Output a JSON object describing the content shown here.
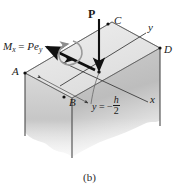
{
  "figure": {
    "caption": "(b)",
    "background_color": "#ffffff",
    "line_color": "#1a1a1a"
  },
  "loads": {
    "force": {
      "label": "P",
      "name": "axial-force-P",
      "direction": "downward-vertical"
    },
    "moment": {
      "label_full": "Mx = Pey",
      "symbol": "M",
      "symbol_sub": "x",
      "equals": "=",
      "rhs": "Pe",
      "rhs_sub": "y",
      "name": "moment-vector-Mx",
      "direction": "double-headed-arrow-left"
    }
  },
  "axes": [
    {
      "label": "y",
      "name": "axis-label-y"
    },
    {
      "label": "x",
      "name": "axis-label-x"
    }
  ],
  "vertices": [
    {
      "label": "A",
      "name": "vertex-label-a"
    },
    {
      "label": "B",
      "name": "vertex-label-b"
    },
    {
      "label": "C",
      "name": "vertex-label-c"
    },
    {
      "label": "D",
      "name": "vertex-label-d"
    }
  ],
  "annotation": {
    "equation_lhs": "y",
    "equation_eq": "= −",
    "fraction_numerator": "h",
    "fraction_denominator": "2",
    "name": "neutral-axis-annotation"
  },
  "colors": {
    "top_face": "#e9e9e9",
    "front_face_light": "#d6d6d6",
    "front_face_dark": "#b8b8b8",
    "side_face": "#cfcfcf",
    "stroke": "#1a1a1a",
    "thin_stroke": "#8a8a8a"
  }
}
